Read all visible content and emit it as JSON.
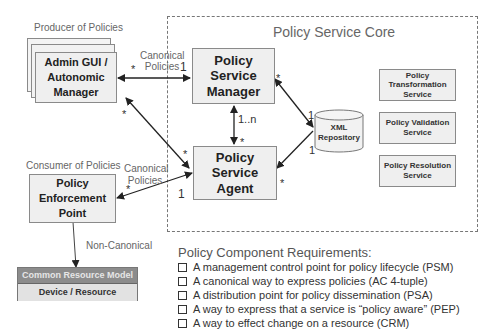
{
  "core": {
    "title": "Policy Service Core"
  },
  "producer": {
    "caption": "Producer of Policies",
    "box": "Admin GUI / Autonomic Manager"
  },
  "consumer": {
    "caption": "Consumer of Policies",
    "box": "Policy Enforcement Point"
  },
  "psm": {
    "label": "Policy Service Manager"
  },
  "psa": {
    "label": "Policy Service Agent"
  },
  "repo": {
    "label": "XML Repository"
  },
  "services": [
    {
      "label": "Policy Transformation Service"
    },
    {
      "label": "Policy Validation Service"
    },
    {
      "label": "Policy Resolution Service"
    }
  ],
  "crm": {
    "header": "Common Resource Model",
    "body": "Device / Resource"
  },
  "edges": {
    "canonical_top": "Canonical Policies",
    "canonical_bottom": "Canonical Policies",
    "non_canonical": "Non-Canonical",
    "admin_psm_star": "*",
    "admin_psm_one": "1",
    "admin_psa_star_admin": "*",
    "admin_psa_star_psa": "*",
    "psm_psa_n": "1..n",
    "psm_psa_star": "*",
    "psm_repo_star": "*",
    "psm_repo_one": "1",
    "repo_psa_one": "1",
    "repo_psa_star": "*",
    "pep_psa_star": "*",
    "pep_psa_one": "1"
  },
  "requirements": {
    "title": "Policy Component Requirements:",
    "items": [
      "A management control point for policy lifecycle (PSM)",
      "A canonical way to express policies (AC 4-tuple)",
      "A distribution point for policy dissemination (PSA)",
      "A way to express that a service is “policy aware” (PEP)",
      "A way to effect change on a resource (CRM)"
    ]
  }
}
